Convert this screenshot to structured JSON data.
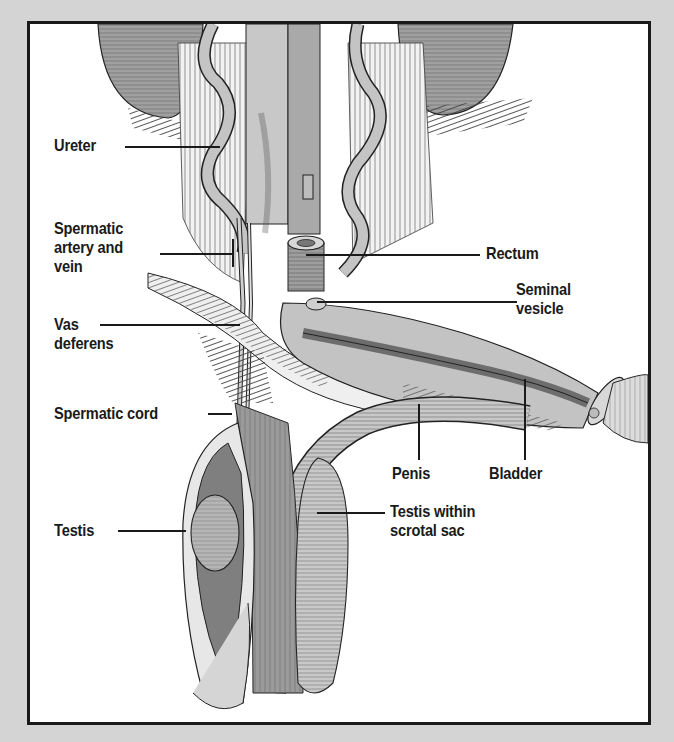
{
  "figure": {
    "colors": {
      "background": "#d4d4d4",
      "panel": "#ffffff",
      "border": "#1a1a1a",
      "tissue_light": "#c9c9c9",
      "tissue_mid": "#a8a8a8",
      "tissue_dark": "#7a7a7a",
      "ink": "#1a1a1a"
    }
  },
  "labels": {
    "ureter": "Ureter",
    "spermatic_artery_vein": "Spermatic\nartery and\nvein",
    "vas_deferens": "Vas\ndeferens",
    "spermatic_cord": "Spermatic cord",
    "testis": "Testis",
    "rectum": "Rectum",
    "seminal_vesicle": "Seminal\nvesicle",
    "penis": "Penis",
    "bladder": "Bladder",
    "testis_scrotal": "Testis within\nscrotal sac"
  }
}
